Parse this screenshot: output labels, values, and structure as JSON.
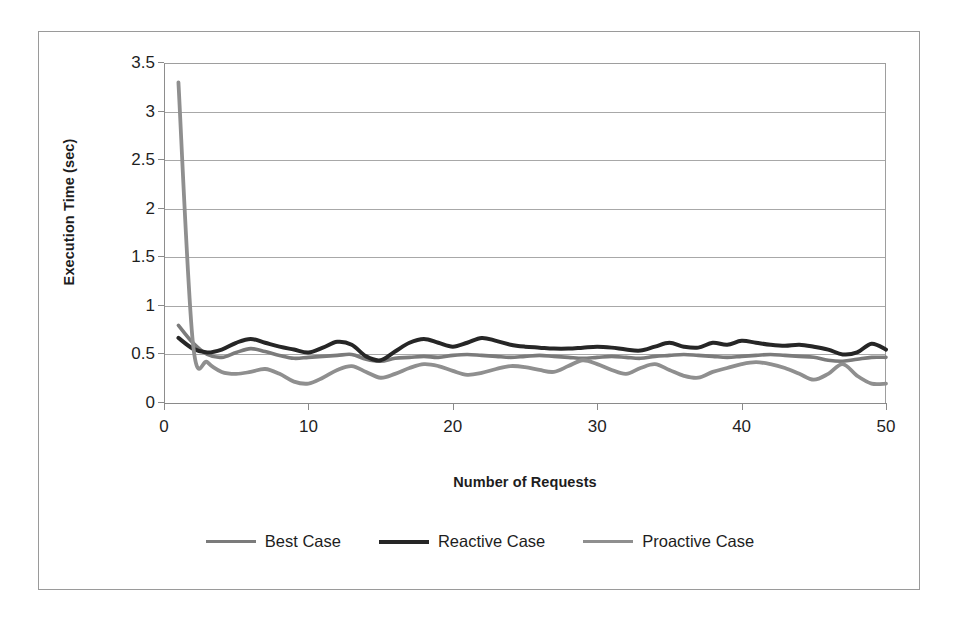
{
  "chart_data": {
    "type": "line",
    "title": "",
    "xlabel": "Number of Requests",
    "ylabel": "Execution Time (sec)",
    "xlim": [
      0,
      50
    ],
    "ylim": [
      0,
      3.5
    ],
    "xticks": [
      "0",
      "10",
      "20",
      "30",
      "40",
      "50"
    ],
    "xtick_values": [
      0,
      10,
      20,
      30,
      40,
      50
    ],
    "yticks": [
      "0",
      "0.5",
      "1",
      "1.5",
      "2",
      "2.5",
      "3",
      "3.5"
    ],
    "ytick_values": [
      0,
      0.5,
      1,
      1.5,
      2,
      2.5,
      3,
      3.5
    ],
    "grid": true,
    "legend_position": "bottom",
    "x": [
      1,
      2,
      3,
      4,
      5,
      6,
      7,
      8,
      9,
      10,
      11,
      12,
      13,
      14,
      15,
      16,
      17,
      18,
      19,
      20,
      21,
      22,
      23,
      24,
      25,
      26,
      27,
      28,
      29,
      30,
      31,
      32,
      33,
      34,
      35,
      36,
      37,
      38,
      39,
      40,
      41,
      42,
      43,
      44,
      45,
      46,
      47,
      48,
      49,
      50
    ],
    "series": [
      {
        "name": "Best Case",
        "color": "#7b7b7b",
        "width": 3.6,
        "values": [
          0.8,
          0.62,
          0.5,
          0.47,
          0.52,
          0.56,
          0.53,
          0.49,
          0.46,
          0.47,
          0.48,
          0.49,
          0.5,
          0.45,
          0.43,
          0.46,
          0.47,
          0.48,
          0.47,
          0.49,
          0.5,
          0.49,
          0.48,
          0.47,
          0.48,
          0.49,
          0.48,
          0.47,
          0.46,
          0.47,
          0.48,
          0.47,
          0.46,
          0.48,
          0.49,
          0.5,
          0.49,
          0.48,
          0.47,
          0.48,
          0.49,
          0.5,
          0.49,
          0.48,
          0.47,
          0.44,
          0.43,
          0.45,
          0.47,
          0.47
        ]
      },
      {
        "name": "Reactive Case",
        "color": "#262626",
        "width": 4.0,
        "values": [
          0.67,
          0.56,
          0.52,
          0.55,
          0.62,
          0.66,
          0.62,
          0.58,
          0.55,
          0.52,
          0.57,
          0.63,
          0.6,
          0.48,
          0.44,
          0.53,
          0.62,
          0.66,
          0.62,
          0.58,
          0.62,
          0.67,
          0.64,
          0.6,
          0.58,
          0.57,
          0.56,
          0.56,
          0.57,
          0.58,
          0.57,
          0.55,
          0.54,
          0.58,
          0.62,
          0.58,
          0.57,
          0.62,
          0.6,
          0.64,
          0.62,
          0.6,
          0.59,
          0.6,
          0.58,
          0.55,
          0.5,
          0.52,
          0.61,
          0.55
        ]
      },
      {
        "name": "Proactive Case",
        "color": "#8f8f8f",
        "width": 3.8,
        "values": [
          3.3,
          0.62,
          0.42,
          0.32,
          0.3,
          0.32,
          0.35,
          0.3,
          0.22,
          0.2,
          0.26,
          0.34,
          0.38,
          0.32,
          0.26,
          0.3,
          0.36,
          0.4,
          0.38,
          0.33,
          0.29,
          0.31,
          0.35,
          0.38,
          0.37,
          0.34,
          0.32,
          0.38,
          0.44,
          0.4,
          0.34,
          0.3,
          0.36,
          0.4,
          0.34,
          0.28,
          0.26,
          0.32,
          0.36,
          0.4,
          0.42,
          0.4,
          0.36,
          0.3,
          0.24,
          0.3,
          0.4,
          0.28,
          0.2,
          0.2
        ]
      }
    ]
  },
  "legend": {
    "entries": [
      {
        "label": "Best Case"
      },
      {
        "label": "Reactive Case"
      },
      {
        "label": "Proactive Case"
      }
    ]
  }
}
